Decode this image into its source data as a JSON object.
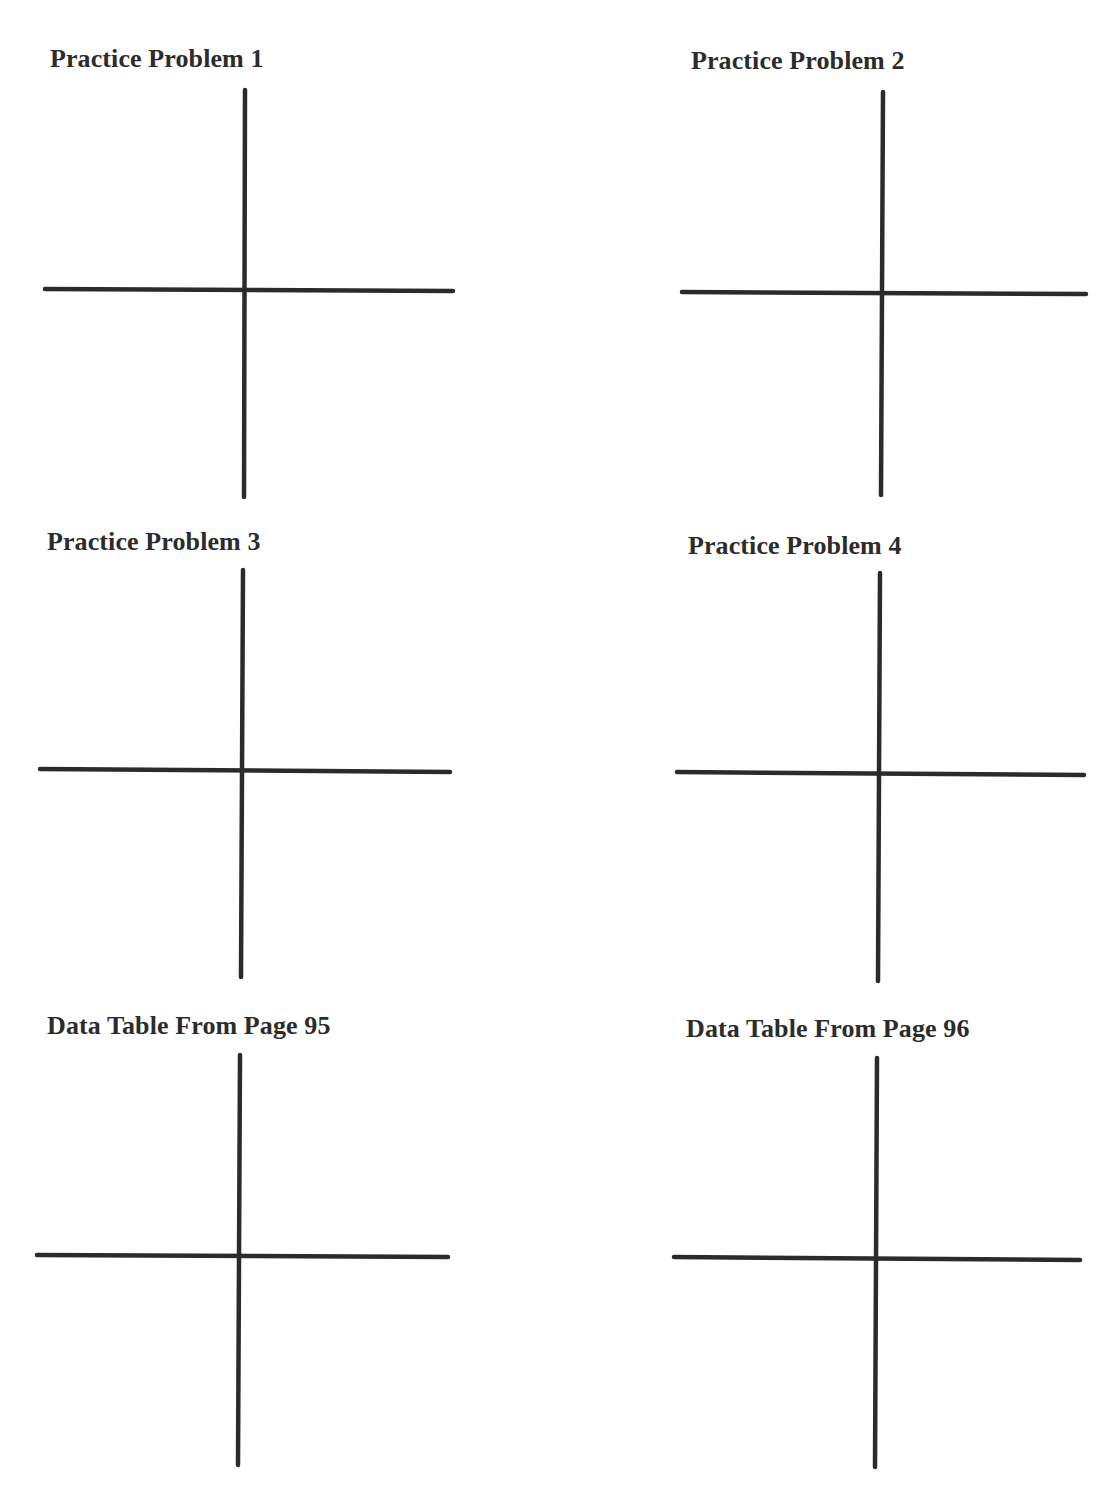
{
  "worksheet": {
    "sections": [
      {
        "title": "Practice Problem 1",
        "heading_pos": {
          "x": 50,
          "y": 44
        },
        "axes": {
          "v": {
            "x": 245,
            "y1": 90,
            "y2": 497
          },
          "h": {
            "y": 289,
            "x1": 45,
            "x2": 453,
            "y2": 291
          }
        }
      },
      {
        "title": "Practice Problem 2",
        "heading_pos": {
          "x": 691,
          "y": 46
        },
        "axes": {
          "v": {
            "x": 882,
            "y1": 92,
            "y2": 495
          },
          "h": {
            "y": 292,
            "x1": 682,
            "x2": 1086,
            "y2": 294
          }
        }
      },
      {
        "title": "Practice Problem 3",
        "heading_pos": {
          "x": 47,
          "y": 527
        },
        "axes": {
          "v": {
            "x": 242,
            "y1": 570,
            "y2": 977
          },
          "h": {
            "y": 769,
            "x1": 40,
            "x2": 450,
            "y2": 772
          }
        }
      },
      {
        "title": "Practice Problem 4",
        "heading_pos": {
          "x": 688,
          "y": 531
        },
        "axes": {
          "v": {
            "x": 879,
            "y1": 573,
            "y2": 981
          },
          "h": {
            "y": 772,
            "x1": 677,
            "x2": 1084,
            "y2": 775
          }
        }
      },
      {
        "title": "Data Table From Page 95",
        "heading_pos": {
          "x": 47,
          "y": 1011
        },
        "axes": {
          "v": {
            "x": 239,
            "y1": 1055,
            "y2": 1465
          },
          "h": {
            "y": 1255,
            "x1": 37,
            "x2": 448,
            "y2": 1257
          }
        }
      },
      {
        "title": "Data Table From Page 96",
        "heading_pos": {
          "x": 686,
          "y": 1014
        },
        "axes": {
          "v": {
            "x": 876,
            "y1": 1058,
            "y2": 1467
          },
          "h": {
            "y": 1257,
            "x1": 674,
            "x2": 1080,
            "y2": 1260
          }
        }
      }
    ],
    "line_color": "#2b2b2b",
    "text_color": "#2c2c2c"
  }
}
